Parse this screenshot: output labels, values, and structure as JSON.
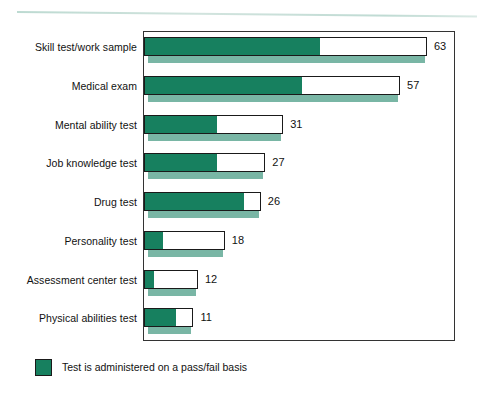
{
  "chart_data": {
    "type": "bar",
    "orientation": "horizontal",
    "title": "",
    "xlabel": "",
    "ylabel": "",
    "xlim": [
      0,
      63
    ],
    "grid": false,
    "categories": [
      "Skill test/work sample",
      "Medical exam",
      "Mental ability test",
      "Job knowledge test",
      "Drug test",
      "Personality test",
      "Assessment center test",
      "Physical abilities test"
    ],
    "values": [
      63,
      57,
      31,
      27,
      26,
      18,
      12,
      11
    ],
    "value_labels": [
      "63",
      "57",
      "31",
      "27",
      "26",
      "18",
      "12",
      "11"
    ],
    "series": [
      {
        "name": "Test is administered on a pass/fail basis",
        "values": [
          39,
          35,
          16,
          16,
          22,
          4,
          2,
          7
        ],
        "color": "#17805f"
      },
      {
        "name": "Remainder",
        "values": [
          24,
          22,
          15,
          11,
          4,
          14,
          10,
          4
        ],
        "color": "#ffffff"
      }
    ],
    "legend": {
      "position": "bottom-left",
      "entries": [
        {
          "label": "Test is administered on a pass/fail basis",
          "color": "#17805f"
        }
      ]
    },
    "colors": {
      "pass_fail_green": "#17805f",
      "shadow_green": "#79b6a5",
      "bar_outline": "#1a1a1a",
      "frame": "#333333",
      "top_rule": "#bcd9d1",
      "text": "#111111"
    }
  }
}
